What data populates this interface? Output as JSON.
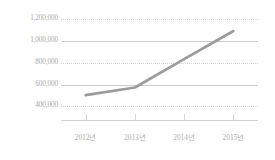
{
  "chart_data": {
    "type": "line",
    "title": "",
    "subtitle": "",
    "xlabel": "",
    "ylabel": "",
    "categories": [
      "2012년",
      "2013년",
      "2014년",
      "2015년"
    ],
    "values": [
      500000,
      570000,
      830000,
      1090000
    ],
    "series": [
      {
        "name": "",
        "values": [
          500000,
          570000,
          830000,
          1090000
        ]
      }
    ],
    "ylim": [
      300000,
      1200000
    ],
    "yticks": [
      1200000,
      1000000,
      800000,
      600000,
      400000
    ],
    "ytick_labels": [
      "1,200,000",
      "1,000,000",
      "800,000",
      "600,000",
      "400,000"
    ],
    "ytick_styles": [
      "dotted",
      "solid",
      "dotted",
      "solid",
      "dotted"
    ],
    "grid": true,
    "legend": "none",
    "line_color": "#9b9b9b",
    "label_color": "#a9a9a9",
    "gridline_color": "#d8d8d8",
    "axis_color": "#d0d0d0",
    "background_color": "#ffffff"
  }
}
